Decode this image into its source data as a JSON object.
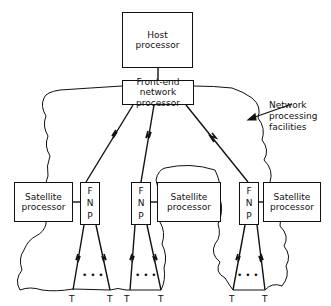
{
  "diagram": {
    "host": {
      "label": "Host\nprocessor"
    },
    "front_end": {
      "label": "Front-end\nnetwork processor"
    },
    "annotation": {
      "label": "Network\nprocessing\nfacilities"
    },
    "clusters": [
      {
        "fnp_label": "F\nN\nP",
        "satellite_label": "Satellite\nprocessor",
        "terminal_left": "T",
        "terminal_right": "T",
        "ellipsis": "• • •"
      },
      {
        "fnp_label": "F\nN\nP",
        "satellite_label": "Satellite\nprocessor",
        "terminal_left": "T",
        "terminal_right": "T",
        "ellipsis": "• • •"
      },
      {
        "fnp_label": "F\nN\nP",
        "satellite_label": "Satellite\nprocessor",
        "terminal_left": "T",
        "terminal_right": "T",
        "ellipsis": "• • •"
      }
    ],
    "colors": {
      "line": "#111111",
      "background": "#ffffff"
    }
  }
}
